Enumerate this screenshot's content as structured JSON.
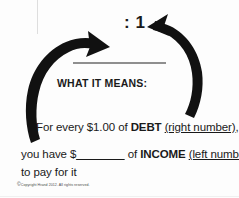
{
  "diagram": {
    "title_visible": false,
    "ratio_label": ": 1",
    "blank_rule_name": "ratio-blank-line",
    "heading": "WHAT IT MEANS:",
    "lines": {
      "debt": {
        "prefix": "For every $1.00 of ",
        "keyword": "DEBT",
        "annotation": "(right number)",
        "suffix": ","
      },
      "income": {
        "prefix": "you have $",
        "blank": "_______",
        "middle": " of ",
        "keyword": "INCOME",
        "annotation": "(left number)"
      },
      "pay": "to pay for it"
    },
    "copyright": {
      "mark": "©",
      "text": "Copyright Hrand 2012. All rights reserved."
    },
    "arrows": [
      {
        "name": "left-curved-arrow",
        "direction": "counterclockwise-upward-right",
        "color": "#111111"
      },
      {
        "name": "right-curved-arrow",
        "direction": "counterclockwise-upward-left",
        "color": "#111111"
      }
    ],
    "colors": {
      "ink": "#1a1a1a",
      "arrow": "#111111",
      "rule": "#8f8f8f",
      "background": "#fdfdfd"
    }
  }
}
